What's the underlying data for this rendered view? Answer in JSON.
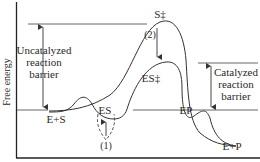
{
  "diagram": {
    "y_axis_label": "Free energy",
    "labels": {
      "transition_uncatalyzed": "S‡",
      "transition_catalyzed": "ES‡",
      "enzyme_substrate": "ES",
      "enzyme_product": "EP",
      "reactants": "E+S",
      "products": "E+P",
      "step_1": "(1)",
      "step_2": "(2)"
    },
    "uncatalyzed_barrier": {
      "line1": "Uncatalyzed",
      "line2": "reaction",
      "line3": "barrier"
    },
    "catalyzed_barrier": {
      "line1": "Catalyzed",
      "line2": "reaction",
      "line3": "barrier"
    },
    "colors": {
      "stroke": "#333333",
      "text": "#2a2a2a",
      "guide_line": "#555555"
    }
  }
}
